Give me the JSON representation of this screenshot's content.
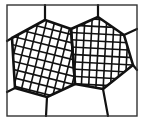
{
  "diagram": {
    "type": "grain-structure",
    "colors": {
      "background": "#ffffff",
      "ink": "#111111",
      "frame": "#333333"
    },
    "frame": {
      "x": 7,
      "y": 5,
      "width": 130,
      "height": 111
    },
    "grains": [
      {
        "id": "grain-left",
        "hatched": true,
        "hatch_angle_deg": 14,
        "hatch_spacing": 8,
        "points": [
          [
            12,
            38
          ],
          [
            45,
            20
          ],
          [
            71,
            29
          ],
          [
            75,
            84
          ],
          [
            47,
            97
          ],
          [
            15,
            88
          ]
        ]
      },
      {
        "id": "grain-right",
        "hatched": true,
        "hatch_angle_deg": 3,
        "hatch_spacing": 7.3,
        "points": [
          [
            71,
            29
          ],
          [
            98,
            17
          ],
          [
            124,
            35
          ],
          [
            133,
            65
          ],
          [
            103,
            89
          ],
          [
            75,
            84
          ]
        ]
      }
    ],
    "boundaries": [
      [
        [
          45,
          20
        ],
        [
          45,
          5
        ]
      ],
      [
        [
          98,
          17
        ],
        [
          98,
          5
        ]
      ],
      [
        [
          124,
          35
        ],
        [
          137,
          29
        ]
      ],
      [
        [
          133,
          65
        ],
        [
          137,
          70
        ]
      ],
      [
        [
          103,
          89
        ],
        [
          108,
          116
        ]
      ],
      [
        [
          47,
          97
        ],
        [
          46,
          116
        ]
      ],
      [
        [
          15,
          88
        ],
        [
          7,
          92
        ]
      ],
      [
        [
          12,
          38
        ],
        [
          7,
          41
        ]
      ]
    ]
  }
}
